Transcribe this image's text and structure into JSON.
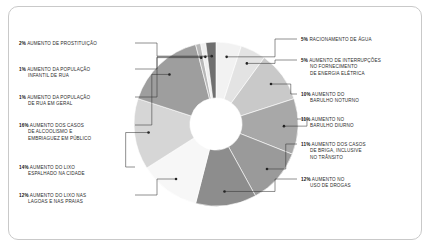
{
  "chart_data": {
    "type": "pie",
    "title": "",
    "variant": "donut",
    "units": "percent",
    "legend": "callout-labels",
    "categories": [
      "RACIONAMENTO DE ÁGUA",
      "AUMENTO DE INTERRUPÇÕES NO FORNECIMENTO DE ENERGIA ELÉTRICA",
      "AUMENTO DO BARULHO NOTURNO",
      "AUMENTO NO BARULHO DIURNO",
      "AUMENTO DOS CASOS DE BRIGA, INCLUSIVE NO TRÂNSITO",
      "AUMENTO NO USO DE DROGAS",
      "AUMENTO DO LIXO NAS LAGOAS E NAS PRAIAS",
      "AUMENTO DO LIXO ESPALHADO NA CIDADE",
      "AUMENTO DOS CASOS DE ALCOOLISMO E EMBRIAGUEZ EM PÚBLICO",
      "AUMENTO DA POPULAÇÃO DE RUA EM GERAL",
      "AUMENTO DA POPULAÇÃO INFANTIL DE RUA",
      "AUMENTO DE PROSTITUIÃO"
    ],
    "values": [
      5,
      5,
      10,
      11,
      11,
      12,
      12,
      14,
      16,
      1,
      1,
      2
    ],
    "colors": [
      "#f2f2f2",
      "#e3e3e3",
      "#c9c9c9",
      "#a8a8a8",
      "#9a9a9a",
      "#8d8d8d",
      "#f7f7f7",
      "#d6d6d6",
      "#9e9e9e",
      "#b8b8b8",
      "#efefef",
      "#6f6f6f"
    ]
  },
  "slices": [
    {
      "pct": "5%",
      "l1": "RACIONAMENTO DE ÁGUA",
      "l2": "",
      "l3": ""
    },
    {
      "pct": "5%",
      "l1": "AUMENTO DE INTERRUPÇÕES",
      "l2": "NO FORNECIMENTO",
      "l3": "DE ENERGIA ELÉTRICA"
    },
    {
      "pct": "10%",
      "l1": "AUMENTO DO",
      "l2": "BARULHO NOTURNO",
      "l3": ""
    },
    {
      "pct": "11%",
      "l1": "AUMENTO NO",
      "l2": "BARULHO DIURNO",
      "l3": ""
    },
    {
      "pct": "11%",
      "l1": "AUMENTO DOS CASOS",
      "l2": "DE BRIGA, INCLUSIVE",
      "l3": "NO TRÂNSITO"
    },
    {
      "pct": "12%",
      "l1": "AUMENTO NO",
      "l2": "USO DE DROGAS",
      "l3": ""
    },
    {
      "pct": "12%",
      "l1": "AUMENTO DO LIXO NAS",
      "l2": "LAGOAS E NAS PRAIAS",
      "l3": ""
    },
    {
      "pct": "14%",
      "l1": "AUMENTO DO LIXO",
      "l2": "ESPALHADO NA CIDADE",
      "l3": ""
    },
    {
      "pct": "16%",
      "l1": "AUMENTO DOS CASOS",
      "l2": "DE ALCOOLISMO E",
      "l3": "EMBRIAGUEZ EM PÚBLICO"
    },
    {
      "pct": "1%",
      "l1": "AUMENTO DA POPULAÇÃO",
      "l2": "DE RUA EM GERAL",
      "l3": ""
    },
    {
      "pct": "1%",
      "l1": "AUMENTO DA POPULAÇÃO",
      "l2": "INFANTIL DE RUA",
      "l3": ""
    },
    {
      "pct": "2%",
      "l1": "AUMENTO DE PROSTITUIÇÃO",
      "l2": "",
      "l3": ""
    }
  ]
}
